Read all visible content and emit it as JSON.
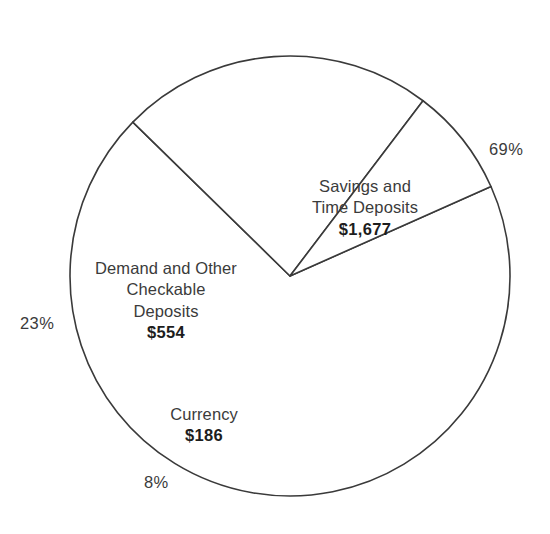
{
  "chart_data": {
    "type": "pie",
    "title": "",
    "subtitle": "",
    "xlabel": "",
    "ylabel": "",
    "grid": false,
    "legend": "none",
    "units": "billions of dollars",
    "total_value": 2417,
    "categories": [
      "Savings and Time Deposits",
      "Demand and Other Checkable Deposits",
      "Currency"
    ],
    "values": [
      1677,
      554,
      186
    ],
    "percentages": [
      69,
      23,
      8
    ],
    "slices": [
      {
        "name": "savings-and-time-deposits",
        "label_line1": "Savings and",
        "label_line2": "Time Deposits",
        "value_label": "$1,677",
        "value": 1677,
        "percent": 69,
        "percent_label": "69%",
        "start_angle_deg": -24,
        "end_angle_deg": 224.4,
        "color": "#ffffff",
        "stroke": "#3a3a3a"
      },
      {
        "name": "demand-and-other-checkable-deposits",
        "label_line1": "Demand and Other",
        "label_line2": "Checkable",
        "label_line3": "Deposits",
        "value_label": "$554",
        "value": 554,
        "percent": 23,
        "percent_label": "23%",
        "start_angle_deg": 224.4,
        "end_angle_deg": 307.2,
        "color": "#ffffff",
        "stroke": "#3a3a3a"
      },
      {
        "name": "currency",
        "label_line1": "Currency",
        "value_label": "$186",
        "value": 186,
        "percent": 8,
        "percent_label": "8%",
        "start_angle_deg": 307.2,
        "end_angle_deg": 336,
        "color": "#ffffff",
        "stroke": "#3a3a3a"
      }
    ],
    "geometry": {
      "center_x": 290,
      "center_y": 276,
      "radius": 220
    }
  },
  "labels": {
    "savings": {
      "line1": "Savings and",
      "line2": "Time Deposits",
      "value": "$1,677",
      "percent": "69%"
    },
    "demand": {
      "line1": "Demand and Other",
      "line2": "Checkable",
      "line3": "Deposits",
      "value": "$554",
      "percent": "23%"
    },
    "currency": {
      "line1": "Currency",
      "value": "$186",
      "percent": "8%"
    }
  },
  "colors": {
    "background": "#ffffff",
    "stroke": "#3a3a3a",
    "text": "#3b3b3b",
    "value_text": "#1d1d1d"
  }
}
